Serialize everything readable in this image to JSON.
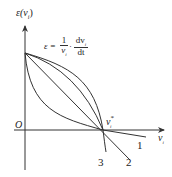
{
  "diagram": {
    "y_axis_label": "ε(v",
    "y_axis_label_sub": "i",
    "y_axis_label_close": ")",
    "x_axis_label": "v",
    "x_axis_label_sub": "i",
    "origin_label": "O",
    "intersection_label": "v",
    "intersection_sub": "i",
    "intersection_sup": "*",
    "formula": {
      "lhs": "ε =",
      "frac1_num": "1",
      "frac1_den": "v",
      "frac1_den_sub": "i",
      "dot": "·",
      "frac2_num": "dv",
      "frac2_num_sub": "i",
      "frac2_den": "dt"
    },
    "curves": [
      {
        "id": "1",
        "label": "1",
        "shape": "convex, shallow slope past v*"
      },
      {
        "id": "2",
        "label": "2",
        "shape": "straight line"
      },
      {
        "id": "3",
        "label": "3",
        "shape": "concave, steep past v*"
      }
    ],
    "colors": {
      "stroke": "#333333",
      "text": "#222222"
    }
  }
}
